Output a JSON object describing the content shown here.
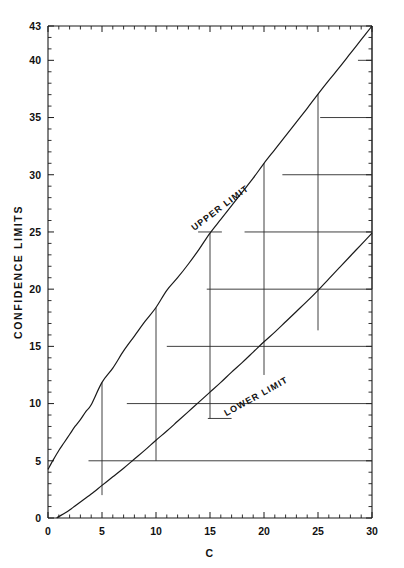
{
  "chart_data": {
    "type": "line",
    "title": "",
    "xlabel": "C",
    "ylabel": "CONFIDENCE  LIMITS",
    "xlim": [
      0,
      30
    ],
    "ylim": [
      0,
      43
    ],
    "grid": false,
    "legend_position": "inline-annotations",
    "x_ticks_major": [
      0,
      5,
      10,
      15,
      20,
      25,
      30
    ],
    "x_tick_labels": [
      "0",
      "5",
      "10",
      "15",
      "20",
      "25",
      "30"
    ],
    "x_tick_minor_step": 1,
    "y_ticks_major": [
      0,
      5,
      10,
      15,
      20,
      25,
      30,
      35,
      40,
      43
    ],
    "y_tick_labels": [
      "0",
      "5",
      "10",
      "15",
      "20",
      "25",
      "30",
      "35",
      "40",
      "43"
    ],
    "y_tick_minor_step": 1,
    "annotations": [
      {
        "text": "UPPER LIMIT",
        "x": 16.1,
        "y": 26.9,
        "rotation": -37
      },
      {
        "text": "LOWER LIMIT",
        "x": 19.4,
        "y": 10.4,
        "rotation": -29
      }
    ],
    "series": [
      {
        "name": "UPPER LIMIT",
        "points": [
          [
            0.0,
            4.25
          ],
          [
            0.5,
            5.1
          ],
          [
            1.0,
            5.9
          ],
          [
            1.5,
            6.6
          ],
          [
            2.0,
            7.3
          ],
          [
            2.5,
            8.0
          ],
          [
            3.0,
            8.6
          ],
          [
            3.5,
            9.3
          ],
          [
            4.0,
            9.9
          ],
          [
            5.0,
            11.85
          ],
          [
            6.0,
            13.1
          ],
          [
            7.0,
            14.6
          ],
          [
            8.0,
            15.9
          ],
          [
            9.0,
            17.2
          ],
          [
            10.0,
            18.4
          ],
          [
            11.0,
            19.9
          ],
          [
            12.0,
            21.0
          ],
          [
            13.0,
            22.2
          ],
          [
            14.0,
            23.5
          ],
          [
            15.0,
            24.9
          ],
          [
            16.0,
            26.1
          ],
          [
            17.0,
            27.3
          ],
          [
            18.0,
            28.5
          ],
          [
            19.0,
            29.7
          ],
          [
            20.0,
            31.0
          ],
          [
            21.0,
            32.2
          ],
          [
            22.0,
            33.4
          ],
          [
            23.0,
            34.6
          ],
          [
            24.0,
            35.8
          ],
          [
            25.0,
            37.05
          ],
          [
            26.0,
            38.25
          ],
          [
            27.0,
            39.4
          ],
          [
            28.0,
            40.6
          ],
          [
            29.0,
            41.8
          ],
          [
            30.0,
            43.0
          ]
        ]
      },
      {
        "name": "LOWER LIMIT",
        "points": [
          [
            0.8,
            0.0
          ],
          [
            1.0,
            0.12
          ],
          [
            1.5,
            0.4
          ],
          [
            2.0,
            0.7
          ],
          [
            2.5,
            1.05
          ],
          [
            3.0,
            1.4
          ],
          [
            3.5,
            1.75
          ],
          [
            4.0,
            2.1
          ],
          [
            5.0,
            2.85
          ],
          [
            6.0,
            3.6
          ],
          [
            7.0,
            4.35
          ],
          [
            8.0,
            5.15
          ],
          [
            9.0,
            5.95
          ],
          [
            10.0,
            6.8
          ],
          [
            11.0,
            7.6
          ],
          [
            12.0,
            8.45
          ],
          [
            13.0,
            9.3
          ],
          [
            14.0,
            10.15
          ],
          [
            15.0,
            11.0
          ],
          [
            16.0,
            11.85
          ],
          [
            17.0,
            12.75
          ],
          [
            18.0,
            13.6
          ],
          [
            19.0,
            14.5
          ],
          [
            20.0,
            15.4
          ],
          [
            21.0,
            16.25
          ],
          [
            22.0,
            17.15
          ],
          [
            23.0,
            18.05
          ],
          [
            24.0,
            18.95
          ],
          [
            25.0,
            19.9
          ],
          [
            26.0,
            20.9
          ],
          [
            27.0,
            21.9
          ],
          [
            28.0,
            22.9
          ],
          [
            29.0,
            23.9
          ],
          [
            30.0,
            24.9
          ]
        ]
      }
    ],
    "step_horizontal_lines": [
      {
        "y": 5,
        "x_from": 3.75,
        "x_to": 30.0
      },
      {
        "y": 10,
        "x_from": 7.3,
        "x_to": 30.0
      },
      {
        "y": 15,
        "x_from": 11.0,
        "x_to": 30.0
      },
      {
        "y": 20,
        "x_from": 14.7,
        "x_to": 30.0
      },
      {
        "y": 25,
        "x_from": 13.9,
        "x_to": 16.1
      },
      {
        "y": 25,
        "x_from": 18.2,
        "x_to": 30.0
      },
      {
        "y": 30,
        "x_from": 21.7,
        "x_to": 30.0
      },
      {
        "y": 35,
        "x_from": 25.2,
        "x_to": 30.0
      },
      {
        "y": 40,
        "x_from": 28.7,
        "x_to": 30.0
      },
      {
        "y": 8.7,
        "x_from": 14.8,
        "x_to": 17.0
      }
    ],
    "step_vertical_lines": [
      {
        "x": 5,
        "y_from": 2.0,
        "y_to": 11.85
      },
      {
        "x": 10,
        "y_from": 5.0,
        "y_to": 18.4
      },
      {
        "x": 15,
        "y_from": 8.7,
        "y_to": 24.9
      },
      {
        "x": 20,
        "y_from": 12.5,
        "y_to": 31.0
      },
      {
        "x": 25,
        "y_from": 16.4,
        "y_to": 37.05
      },
      {
        "x": 30,
        "y_from": 20.0,
        "y_to": 43.0
      }
    ]
  }
}
